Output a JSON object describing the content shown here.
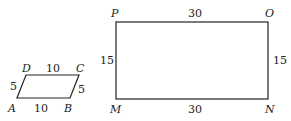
{
  "figures": {
    "parallelogram": {
      "vertices": {
        "A": "A",
        "B": "B",
        "C": "C",
        "D": "D"
      },
      "sides": {
        "AB": "10",
        "DC": "10",
        "AD": "5",
        "BC": "5"
      }
    },
    "rectangle": {
      "vertices": {
        "M": "M",
        "N": "N",
        "O": "O",
        "P": "P"
      },
      "sides": {
        "PO": "30",
        "MN": "30",
        "PM": "15",
        "ON": "15"
      }
    }
  },
  "colors": {
    "stroke": "#222222",
    "background": "#ffffff"
  }
}
